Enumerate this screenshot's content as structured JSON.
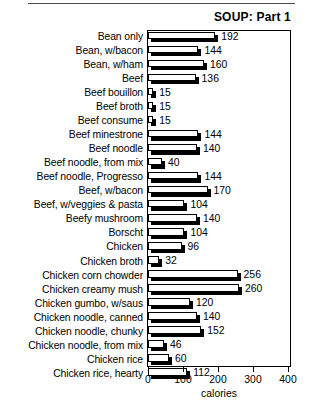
{
  "title": "SOUP: Part 1",
  "axis": {
    "xlabel": "calories",
    "ticks": [
      "0",
      "100",
      "200",
      "300",
      "400"
    ]
  },
  "chart_data": {
    "type": "bar",
    "orientation": "horizontal",
    "title": "SOUP: Part 1",
    "xlabel": "calories",
    "ylabel": "",
    "xlim": [
      0,
      400
    ],
    "xticks": [
      0,
      100,
      200,
      300,
      400
    ],
    "grid": false,
    "legend": null,
    "categories": [
      "Bean only",
      "Bean, w/bacon",
      "Bean, w/ham",
      "Beef",
      "Beef bouillon",
      "Beef broth",
      "Beef consume",
      "Beef minestrone",
      "Beef noodle",
      "Beef noodle, from mix",
      "Beef noodle, Progresso",
      "Beef, w/bacon",
      "Beef, w/veggies & pasta",
      "Beefy mushroom",
      "Borscht",
      "Chicken",
      "Chicken broth",
      "Chicken corn chowder",
      "Chicken creamy mush",
      "Chicken gumbo, w/saus",
      "Chicken noodle, canned",
      "Chicken noodle, chunky",
      "Chicken noodle, from mix",
      "Chicken rice",
      "Chicken rice, hearty"
    ],
    "values": [
      192,
      144,
      160,
      136,
      15,
      15,
      15,
      144,
      140,
      40,
      144,
      170,
      104,
      140,
      104,
      96,
      32,
      256,
      260,
      120,
      140,
      152,
      46,
      60,
      112
    ],
    "data_labels": [
      "192",
      "144",
      "160",
      "136",
      "15",
      "15",
      "15",
      "144",
      "140",
      "40",
      "144",
      "170",
      "104",
      "140",
      "104",
      "96",
      "32",
      "256",
      "260",
      "120",
      "140",
      "152",
      "46",
      "60",
      "112"
    ]
  }
}
